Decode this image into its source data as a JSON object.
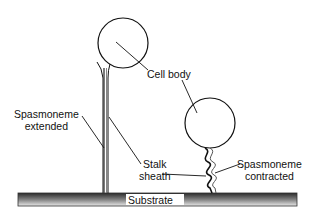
{
  "diagram": {
    "labels": {
      "cell_body": "Cell body",
      "spasmoneme_extended_1": "Spasmoneme",
      "spasmoneme_extended_2": "extended",
      "stalk_sheath_1": "Stalk",
      "stalk_sheath_2": "sheath",
      "spasmoneme_contracted_1": "Spasmoneme",
      "spasmoneme_contracted_2": "contracted",
      "substrate": "Substrate"
    },
    "colors": {
      "line": "#111111",
      "substrate_dark": "#333333",
      "substrate_light": "#e6e6e6",
      "background": "#ffffff"
    }
  }
}
